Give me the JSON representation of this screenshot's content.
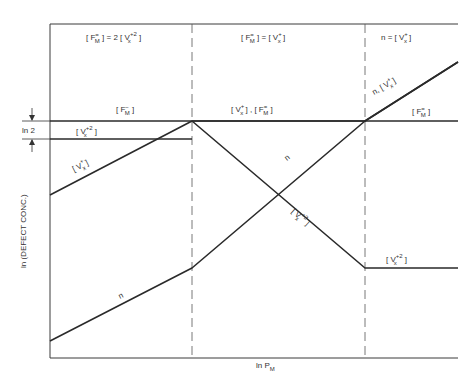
{
  "diagram": {
    "axes": {
      "x_label": "ln P",
      "x_label_sub": "M",
      "y_label": "ln (DEFECT CONC.)",
      "ln2_label": "ln 2"
    },
    "regions": [
      {
        "id": "region-1",
        "condition_parts": [
          "[ F",
          "M",
          "=",
          "] = 2 [ V",
          "x",
          "+2",
          " ]"
        ],
        "condition_text": "[ F_M= ] = 2 [ V_x+2 ]"
      },
      {
        "id": "region-2",
        "condition_text": "[ F_M= ] = [ V_x+ ]"
      },
      {
        "id": "region-3",
        "condition_text": "n = [ V_x+ ]"
      }
    ],
    "curve_labels": {
      "fm_region1": "[ F_M- ]",
      "vx2_region1": "[ V_x+2 ]",
      "vx_region1": "[ V_x+ ]",
      "n_region1": "n",
      "region2_top": "[ V_x+ ] , [ F_M= ]",
      "n_region2": "n",
      "vx2_region2": "[ V_x+2 ]",
      "n_vx_region3": "n, [ V_x+ ]",
      "fm_region3": "[ F_M= ]",
      "vx2_region3": "[ V_x+2 ]"
    },
    "colors": {
      "line": "#2a2a2a",
      "frame": "#3a3a3a",
      "dashed": "#555555",
      "background": "#ffffff"
    }
  }
}
